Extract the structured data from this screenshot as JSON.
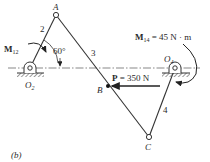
{
  "figure": {
    "caption": "(b)",
    "points": {
      "A": "A",
      "B": "B",
      "C": "C",
      "O2": {
        "base": "O",
        "sub": "2"
      },
      "O4": {
        "base": "O",
        "sub": "4"
      }
    },
    "links": {
      "link2": "2",
      "link3": "3",
      "link4": "4"
    },
    "angle": "60°",
    "moment12": {
      "base": "M",
      "sub": "12"
    },
    "moment14": {
      "base": "M",
      "sub": "14",
      "value": " = 45 N · m"
    },
    "force": {
      "base": "P",
      "value": " = 350 N"
    },
    "colors": {
      "line": "#333333",
      "text": "#2a2a2a",
      "ground": "#777777"
    }
  }
}
